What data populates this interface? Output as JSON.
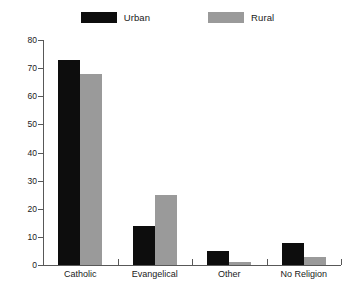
{
  "legend": {
    "entries": [
      {
        "label": "Urban",
        "color": "#0d0d0d",
        "swatch_name": "legend-swatch-urban"
      },
      {
        "label": "Rural",
        "color": "#9a9a9a",
        "swatch_name": "legend-swatch-rural"
      }
    ]
  },
  "axes": {
    "y_ticks": [
      "0",
      "10",
      "20",
      "30",
      "40",
      "50",
      "60",
      "70",
      "80"
    ],
    "x_labels": [
      "Catholic",
      "Evangelical",
      "Other",
      "No Religion"
    ]
  },
  "chart_data": {
    "type": "bar",
    "title": "",
    "subtitle": "",
    "xlabel": "",
    "ylabel": "",
    "categories": [
      "Catholic",
      "Evangelical",
      "Other",
      "No Religion"
    ],
    "series": [
      {
        "name": "Urban",
        "color": "#0d0d0d",
        "values": [
          73,
          14,
          5,
          8
        ]
      },
      {
        "name": "Rural",
        "color": "#9a9a9a",
        "values": [
          68,
          25,
          1,
          3
        ]
      }
    ],
    "ylim": [
      0,
      80
    ],
    "ytick_step": 10,
    "grid": false,
    "legend_position": "top-center",
    "background": "#ffffff"
  }
}
